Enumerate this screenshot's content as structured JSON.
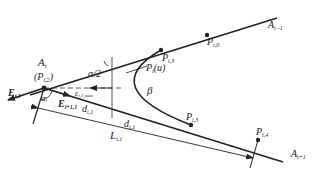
{
  "diagram": {
    "colors": {
      "line": "#222222",
      "background": "#ffffff"
    },
    "labels": {
      "A_i": "A",
      "A_i_sub": "i",
      "P_i2": "(P",
      "P_i2_sub": "i,2",
      "P_i2_close": ")",
      "E_i1": "E",
      "E_i1_sub": "i,1",
      "E_ip1": "E",
      "E_ip1_sub": "i+1,1",
      "eps": "ε",
      "eps_sub": "i,1,max",
      "alpha_half": "α/2",
      "alpha_i": "α",
      "alpha_i_sub": "i",
      "d_upper": "d",
      "d_upper_sub": "i,1",
      "d_lower": "d",
      "d_lower_sub": "i,1",
      "L": "L",
      "L_sub": "i,1",
      "Pu": "P",
      "Pu_sub": "i",
      "Pu_arg": "(u)",
      "beta": "β",
      "P_i3_top": "P",
      "P_i3_top_sub": "i,3",
      "P_i0": "P",
      "P_i0_sub": "i,0",
      "P_i3_bot": "P",
      "P_i3_bot_sub": "i,3",
      "P_i4": "P",
      "P_i4_sub": "i,4",
      "A_im1": "A",
      "A_im1_sub": "i−1",
      "A_ip1": "A",
      "A_ip1_sub": "i+1"
    }
  }
}
